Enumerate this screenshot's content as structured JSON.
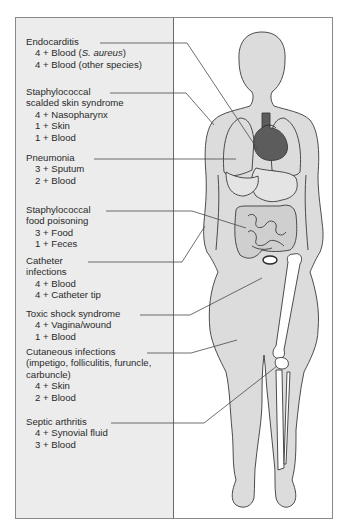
{
  "diagram": {
    "colors": {
      "panel_bg": "#ececec",
      "skin": "#dcdcdc",
      "heart": "#5c5c5c",
      "organ_fill": "#cfcfcf",
      "bone": "#ffffff",
      "outline": "#3a3a3a",
      "leader": "#4a4a4a"
    },
    "labels": [
      {
        "id": "endocarditis",
        "title": "Endocarditis",
        "items": [
          "4 + Blood (S. aureus)",
          "4 + Blood (other species)"
        ],
        "italic_fragment": "S. aureus"
      },
      {
        "id": "ssss",
        "title": "Staphylococcal",
        "title2": "scalded skin syndrome",
        "items": [
          "4 + Nasopharynx",
          "1 + Skin",
          "1 + Blood"
        ]
      },
      {
        "id": "pneumonia",
        "title": "Pneumonia",
        "items": [
          "3 + Sputum",
          "2 + Blood"
        ]
      },
      {
        "id": "food-poisoning",
        "title": "Staphylococcal",
        "title2": "food poisoning",
        "items": [
          "3 + Food",
          "1 + Feces"
        ]
      },
      {
        "id": "catheter",
        "title": "Catheter",
        "title2": "infections",
        "items": [
          "4 + Blood",
          "4 + Catheter tip"
        ]
      },
      {
        "id": "tss",
        "title": "Toxic shock syndrome",
        "items": [
          "4 + Vagina/wound",
          "1 + Blood"
        ]
      },
      {
        "id": "cutaneous",
        "title": "Cutaneous infections",
        "title2": "(impetigo, folliculitis, furuncle,",
        "title3": "carbuncle)",
        "items": [
          "4 + Skin",
          "2 + Blood"
        ]
      },
      {
        "id": "septic-arthritis",
        "title": "Septic arthritis",
        "items": [
          "4 + Synovial fluid",
          "3 + Blood"
        ]
      }
    ]
  }
}
